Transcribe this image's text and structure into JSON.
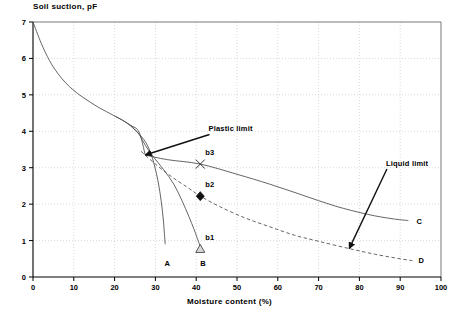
{
  "chart_data": {
    "type": "line",
    "title": "",
    "xlabel": "Moisture content (%)",
    "ylabel": "Soil suction, pF",
    "xlim": [
      0,
      100
    ],
    "ylim": [
      0,
      7
    ],
    "xticks": [
      "0",
      "10",
      "20",
      "30",
      "40",
      "50",
      "60",
      "70",
      "80",
      "90",
      "100"
    ],
    "yticks": [
      "0",
      "1",
      "2",
      "3",
      "4",
      "5",
      "6",
      "7"
    ],
    "grid": true,
    "grid_style": "dotted",
    "legend_position": "none",
    "annotations": [
      {
        "name": "plastic-limit",
        "text": "Plastic limit",
        "label_x": 43,
        "label_y": 4.05,
        "arrow_to_x": 27.5,
        "arrow_to_y": 3.35
      },
      {
        "name": "liquid-limit",
        "text": "Liquid limit",
        "label_x": 86.5,
        "label_y": 3.1,
        "arrow_to_x": 77.5,
        "arrow_to_y": 0.78
      }
    ],
    "point_markers": [
      {
        "name": "b1",
        "label": "b1",
        "marker": "triangle",
        "x": 41,
        "y": 0.77,
        "filled": false
      },
      {
        "name": "b2",
        "label": "b2",
        "marker": "diamond",
        "x": 41,
        "y": 2.22,
        "filled": true
      },
      {
        "name": "b3",
        "label": "b3",
        "marker": "cross",
        "x": 41,
        "y": 3.1,
        "filled": true
      }
    ],
    "series": [
      {
        "name": "main-drying-curve",
        "label": "",
        "style": "solid",
        "points": [
          [
            0,
            7.0
          ],
          [
            2,
            6.42
          ],
          [
            4,
            5.95
          ],
          [
            6,
            5.6
          ],
          [
            8,
            5.33
          ],
          [
            10,
            5.12
          ],
          [
            12,
            4.95
          ],
          [
            14,
            4.8
          ],
          [
            16,
            4.66
          ],
          [
            18,
            4.54
          ],
          [
            20,
            4.42
          ],
          [
            22,
            4.3
          ],
          [
            24,
            4.16
          ],
          [
            26,
            3.98
          ],
          [
            27.5,
            3.35
          ]
        ]
      },
      {
        "name": "curve-A",
        "label": "A",
        "style": "solid",
        "label_x": 32.2,
        "label_y": 0.37,
        "points": [
          [
            20,
            4.42
          ],
          [
            22,
            4.3
          ],
          [
            24,
            4.14
          ],
          [
            26,
            3.92
          ],
          [
            27.5,
            3.72
          ],
          [
            28.8,
            3.42
          ],
          [
            29.8,
            3.05
          ],
          [
            30.7,
            2.6
          ],
          [
            31.4,
            2.1
          ],
          [
            31.9,
            1.62
          ],
          [
            32.2,
            1.2
          ],
          [
            32.4,
            0.9
          ]
        ]
      },
      {
        "name": "curve-B",
        "label": "B",
        "style": "solid",
        "label_x": 41,
        "label_y": 0.35,
        "points": [
          [
            24,
            4.16
          ],
          [
            26,
            3.92
          ],
          [
            27.5,
            3.62
          ],
          [
            29.5,
            3.3
          ],
          [
            32,
            2.95
          ],
          [
            34.5,
            2.55
          ],
          [
            36.5,
            2.1
          ],
          [
            38.2,
            1.66
          ],
          [
            39.5,
            1.3
          ],
          [
            40.4,
            1.02
          ],
          [
            41,
            0.84
          ]
        ]
      },
      {
        "name": "curve-C",
        "label": "C",
        "style": "solid",
        "label_x": 94,
        "label_y": 1.52,
        "points": [
          [
            27.5,
            3.35
          ],
          [
            33,
            3.22
          ],
          [
            41,
            3.1
          ],
          [
            50,
            2.82
          ],
          [
            58,
            2.55
          ],
          [
            66,
            2.25
          ],
          [
            74,
            1.95
          ],
          [
            82,
            1.72
          ],
          [
            88,
            1.6
          ],
          [
            92,
            1.55
          ]
        ]
      },
      {
        "name": "curve-D",
        "label": "D",
        "style": "dashed",
        "label_x": 94.5,
        "label_y": 0.43,
        "points": [
          [
            26.5,
            3.45
          ],
          [
            30,
            3.1
          ],
          [
            34,
            2.75
          ],
          [
            38,
            2.45
          ],
          [
            41,
            2.22
          ],
          [
            46,
            1.92
          ],
          [
            52,
            1.62
          ],
          [
            58,
            1.38
          ],
          [
            64,
            1.15
          ],
          [
            70,
            0.98
          ],
          [
            77.5,
            0.78
          ],
          [
            84,
            0.62
          ],
          [
            90,
            0.5
          ],
          [
            93,
            0.45
          ]
        ]
      }
    ]
  }
}
